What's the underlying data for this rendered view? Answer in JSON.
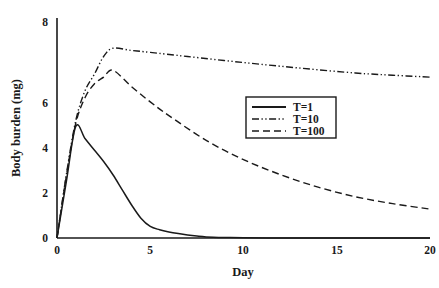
{
  "chart_data": {
    "type": "line",
    "title": "",
    "xlabel": "Day",
    "ylabel": "Body burden (mg)",
    "xlim": [
      0,
      20
    ],
    "ylim": [
      0,
      8
    ],
    "xticks": [
      "0",
      "5",
      "10",
      "15",
      "20"
    ],
    "xtick_values": [
      0,
      5,
      10,
      15,
      20
    ],
    "yticks": [
      "0",
      "2",
      "4",
      "6",
      "8"
    ],
    "ytick_values": [
      0,
      2,
      4,
      6,
      8
    ],
    "grid": false,
    "legend_position": "center-right",
    "line_color": "#1a1a1a",
    "series": [
      {
        "name": "T=1",
        "style": "solid",
        "x": [
          0,
          0.5,
          1.0,
          1.5,
          2.0,
          2.5,
          3.0,
          3.5,
          4.0,
          4.5,
          5.0,
          5.5,
          6.0,
          6.5,
          7.0,
          7.5,
          8.0,
          9.0,
          10.0,
          12.0,
          14.0,
          16.0,
          18.0,
          20.0
        ],
        "values": [
          0.0,
          2.05,
          4.05,
          3.62,
          3.2,
          2.78,
          2.3,
          1.75,
          1.2,
          0.72,
          0.42,
          0.3,
          0.22,
          0.16,
          0.11,
          0.07,
          0.04,
          0.02,
          0.01,
          0.0,
          0.0,
          0.0,
          0.0,
          0.0
        ]
      },
      {
        "name": "T=10",
        "style": "dashdotdot",
        "x": [
          0,
          0.5,
          1.0,
          1.5,
          2.0,
          2.5,
          3.0,
          4.0,
          5.0,
          7.0,
          10.0,
          13.0,
          16.0,
          18.0,
          20.0
        ],
        "values": [
          0.0,
          2.3,
          4.25,
          5.35,
          5.95,
          6.6,
          6.9,
          6.82,
          6.75,
          6.6,
          6.38,
          6.18,
          6.0,
          5.92,
          5.85
        ]
      },
      {
        "name": "T=100",
        "style": "dashed",
        "x": [
          0,
          0.5,
          1.0,
          1.5,
          2.0,
          2.5,
          3.0,
          4.0,
          5.0,
          6.0,
          8.0,
          10.0,
          12.0,
          14.0,
          16.0,
          18.0,
          20.0
        ],
        "values": [
          0.0,
          2.25,
          4.15,
          5.1,
          5.6,
          5.85,
          6.1,
          5.5,
          4.95,
          4.45,
          3.55,
          2.85,
          2.3,
          1.85,
          1.5,
          1.25,
          1.05
        ]
      }
    ]
  },
  "legend": {
    "items": [
      {
        "label": "T=1"
      },
      {
        "label": "T=10"
      },
      {
        "label": "T=100"
      }
    ]
  }
}
